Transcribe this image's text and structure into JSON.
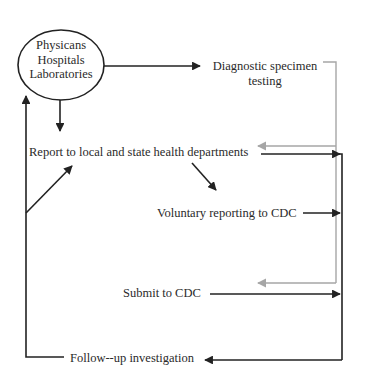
{
  "diagram": {
    "type": "flowchart",
    "colors": {
      "primary_line": "#222222",
      "secondary_line": "#a6a6a6",
      "background": "#ffffff"
    },
    "nodes": {
      "source": {
        "shape": "ellipse",
        "lines": [
          "Physicans",
          "Hospitals",
          "Laboratories"
        ]
      },
      "diagnostic": {
        "lines": [
          "Diagnostic specimen",
          "testing"
        ]
      },
      "report": {
        "label": "Report to local and state health departments"
      },
      "voluntary": {
        "label": "Voluntary reporting to CDC"
      },
      "submit": {
        "label": "Submit to CDC"
      },
      "followup": {
        "label": "Follow--up investigation"
      }
    },
    "edges": [
      {
        "from": "Physicans/Hospitals/Laboratories",
        "to": "Diagnostic specimen testing",
        "color": "black"
      },
      {
        "from": "Physicans/Hospitals/Laboratories",
        "to": "Report to local and state health departments",
        "color": "black"
      },
      {
        "from": "Diagnostic specimen testing",
        "to": "Report to local and state health departments",
        "color": "grey"
      },
      {
        "from": "Diagnostic specimen testing",
        "to": "Submit to CDC",
        "color": "grey"
      },
      {
        "from": "Report to local and state health departments",
        "to": "Voluntary reporting to CDC",
        "color": "black"
      },
      {
        "from": "Report to local and state health departments",
        "to": "CDC collector line",
        "color": "black"
      },
      {
        "from": "Voluntary reporting to CDC",
        "to": "CDC collector line",
        "color": "black"
      },
      {
        "from": "Submit to CDC",
        "to": "CDC collector line",
        "color": "black"
      },
      {
        "from": "CDC collector line",
        "to": "Follow--up investigation",
        "color": "black"
      },
      {
        "from": "Follow--up investigation",
        "to": "Physicans/Hospitals/Laboratories",
        "color": "black"
      },
      {
        "from": "Follow--up investigation",
        "to": "Report to local and state health departments",
        "color": "black"
      }
    ]
  }
}
